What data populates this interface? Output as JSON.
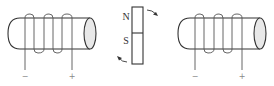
{
  "diagram": {
    "type": "physics-induction",
    "components": [
      {
        "id": "coil-left",
        "kind": "solenoid",
        "terminals": {
          "left": "−",
          "right": "+"
        }
      },
      {
        "id": "bar-magnet",
        "kind": "bar-magnet",
        "poles": {
          "top": "N",
          "bottom": "S"
        },
        "rotation_arrows": 2
      },
      {
        "id": "coil-right",
        "kind": "solenoid",
        "terminals": {
          "left": "−",
          "right": "+"
        }
      }
    ],
    "labels": {
      "north": "N",
      "south": "S",
      "coil_left_minus": "−",
      "coil_left_plus": "+",
      "coil_right_minus": "−",
      "coil_right_plus": "+"
    },
    "colors": {
      "line": "#333333",
      "end_fill": "#e8e8e8",
      "terminal_text": "#888888"
    }
  }
}
